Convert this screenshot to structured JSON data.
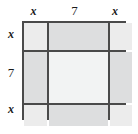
{
  "figure": {
    "title": "",
    "colors": {
      "grid_line": "#4a4a4a",
      "corner_cell": "#ececec",
      "edge_cell": "#dddedf",
      "center_cell": "#f2f3f3",
      "label_text": "#1a1a1a",
      "background": "#ffffff"
    }
  },
  "labels": {
    "top": [
      {
        "text": "x",
        "kind": "var"
      },
      {
        "text": "7",
        "kind": "num"
      },
      {
        "text": "x",
        "kind": "var"
      }
    ],
    "left": [
      {
        "text": "x",
        "kind": "var"
      },
      {
        "text": "7",
        "kind": "num"
      },
      {
        "text": "x",
        "kind": "var"
      }
    ]
  },
  "grid": {
    "rows": 3,
    "columns": 3,
    "column_segments": [
      "x",
      "7",
      "x"
    ],
    "row_segments": [
      "x",
      "7",
      "x"
    ],
    "cells": [
      [
        {
          "shade": "corner",
          "region": "top-left"
        },
        {
          "shade": "edge",
          "region": "top-middle"
        },
        {
          "shade": "corner",
          "region": "top-right"
        }
      ],
      [
        {
          "shade": "edge",
          "region": "middle-left"
        },
        {
          "shade": "center",
          "region": "center"
        },
        {
          "shade": "edge",
          "region": "middle-right"
        }
      ],
      [
        {
          "shade": "corner",
          "region": "bottom-left"
        },
        {
          "shade": "edge",
          "region": "bottom-middle"
        },
        {
          "shade": "corner",
          "region": "bottom-right"
        }
      ]
    ]
  }
}
